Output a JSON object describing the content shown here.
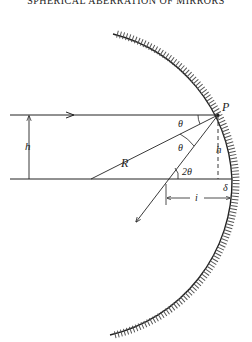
{
  "header": {
    "running_title": "SPHERICAL ABERRATION OF MIRRORS"
  },
  "diagram": {
    "labels": {
      "point": "P",
      "ray_height_left": "h",
      "ray_height_right": "h",
      "radius": "R",
      "angle_incident": "θ",
      "angle_reflected": "θ",
      "angle_axis": "2θ",
      "sag": "δ",
      "image_distance": "i"
    },
    "colors": {
      "ink": "#222222",
      "background": "#ffffff"
    }
  }
}
